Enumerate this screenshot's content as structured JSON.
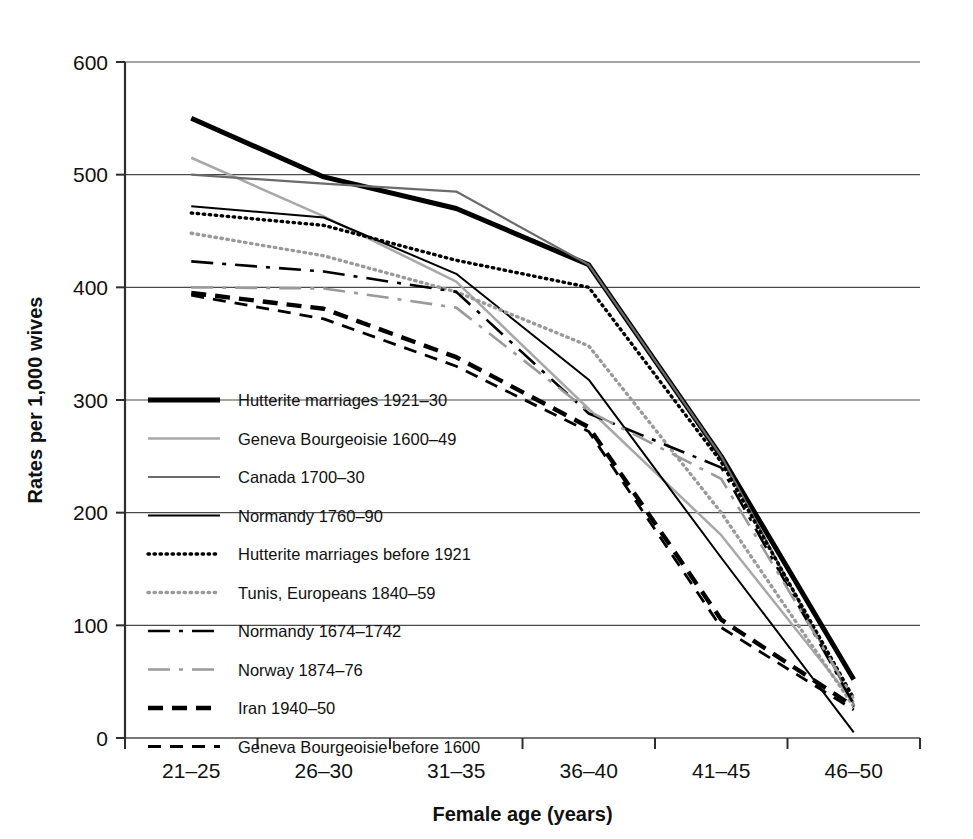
{
  "chart_data": {
    "type": "line",
    "title": "",
    "xlabel": "Female age (years)",
    "ylabel": "Rates per 1,000 wives",
    "categories": [
      "21–25",
      "26–30",
      "31–35",
      "36–40",
      "41–45",
      "46–50"
    ],
    "ylim": [
      0,
      600
    ],
    "yticks": [
      0,
      100,
      200,
      300,
      400,
      500,
      600
    ],
    "grid": "horizontal",
    "legend_position": "inside-left",
    "series": [
      {
        "name": "Hutterite marriages 1921–30",
        "style": "solid",
        "color": "#000000",
        "width": 5,
        "values": [
          550,
          498,
          470,
          420,
          250,
          52
        ]
      },
      {
        "name": "Geneva Bourgeoisie 1600–49",
        "style": "solid",
        "color": "#a8a8a8",
        "width": 2.5,
        "values": [
          515,
          463,
          405,
          292,
          180,
          32
        ]
      },
      {
        "name": "Canada 1700–30",
        "style": "solid",
        "color": "#6b6b6b",
        "width": 2.2,
        "values": [
          500,
          492,
          485,
          420,
          250,
          30
        ]
      },
      {
        "name": "Normandy 1760–90",
        "style": "solid",
        "color": "#000000",
        "width": 2.0,
        "values": [
          472,
          462,
          412,
          318,
          160,
          5
        ]
      },
      {
        "name": "Hutterite marriages before 1921",
        "style": "dotted",
        "color": "#000000",
        "width": 3.4,
        "values": [
          466,
          455,
          424,
          400,
          245,
          35
        ]
      },
      {
        "name": "Tunis, Europeans 1840–59",
        "style": "dotted",
        "color": "#9a9a9a",
        "width": 3.4,
        "values": [
          448,
          428,
          396,
          348,
          200,
          28
        ]
      },
      {
        "name": "Normandy 1674–1742",
        "style": "dashdot",
        "color": "#000000",
        "width": 2.6,
        "values": [
          423,
          414,
          396,
          288,
          240,
          30
        ]
      },
      {
        "name": "Norway 1874–76",
        "style": "dashdot",
        "color": "#9a9a9a",
        "width": 2.6,
        "values": [
          400,
          399,
          382,
          290,
          230,
          35
        ]
      },
      {
        "name": "Iran 1940–50",
        "style": "dashed-thick",
        "color": "#000000",
        "width": 4.4,
        "values": [
          395,
          381,
          338,
          276,
          105,
          28
        ]
      },
      {
        "name": "Geneva Bourgeoisie before 1600",
        "style": "dashed",
        "color": "#000000",
        "width": 2.8,
        "values": [
          393,
          372,
          330,
          272,
          98,
          25
        ]
      }
    ]
  },
  "legend": {
    "items": [
      {
        "label": "Hutterite marriages 1921–30"
      },
      {
        "label": "Geneva Bourgeoisie 1600–49"
      },
      {
        "label": "Canada 1700–30"
      },
      {
        "label": "Normandy 1760–90"
      },
      {
        "label": "Hutterite marriages before 1921"
      },
      {
        "label": "Tunis, Europeans 1840–59"
      },
      {
        "label": "Normandy 1674–1742"
      },
      {
        "label": "Norway 1874–76"
      },
      {
        "label": "Iran 1940–50"
      },
      {
        "label": "Geneva Bourgeoisie before 1600"
      }
    ]
  }
}
